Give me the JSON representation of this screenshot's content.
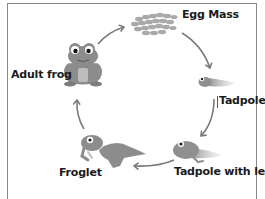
{
  "stages": [
    {
      "id": "egg-mass",
      "label": "Egg Mass"
    },
    {
      "id": "tadpole",
      "label": "Tadpole"
    },
    {
      "id": "tadpole-with-legs",
      "label": "Tadpole with legs"
    },
    {
      "id": "froglet",
      "label": "Froglet"
    },
    {
      "id": "adult-frog",
      "label": "Adult frog"
    }
  ],
  "arrows": [
    {
      "from": "adult-frog",
      "to": "egg-mass"
    },
    {
      "from": "egg-mass",
      "to": "tadpole"
    },
    {
      "from": "tadpole",
      "to": "tadpole-with-legs"
    },
    {
      "from": "tadpole-with-legs",
      "to": "froglet"
    },
    {
      "from": "froglet",
      "to": "adult-frog"
    }
  ],
  "colors": {
    "frog_body": "#8c8c8c",
    "frog_dark": "#6e6e6e",
    "frog_light": "#bdbdbd",
    "arrow": "#7a7a7a",
    "eggs": "#a9a9a9",
    "border": "#8a8a8a"
  }
}
